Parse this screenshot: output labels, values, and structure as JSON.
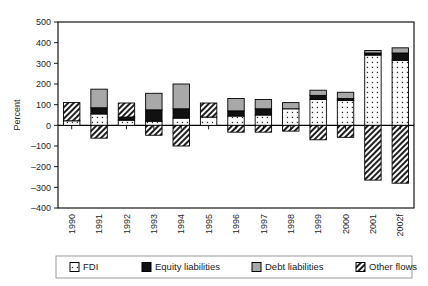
{
  "chart_data": {
    "type": "bar",
    "subtype": "stacked-bar-with-negatives",
    "title": "",
    "xlabel": "",
    "ylabel": "Percent",
    "ylim": [
      -400,
      500
    ],
    "ytick_step": 100,
    "ytick_labels": [
      "500",
      "400",
      "300",
      "200",
      "100",
      "0",
      "–100",
      "–200",
      "–300",
      "–400"
    ],
    "ytick_values": [
      500,
      400,
      300,
      200,
      100,
      0,
      -100,
      -200,
      -300,
      -400
    ],
    "grid": false,
    "legend_position": "bottom",
    "categories": [
      "1990",
      "1991",
      "1992",
      "1993",
      "1994",
      "1995",
      "1996",
      "1997",
      "1998",
      "1999",
      "2000",
      "2001",
      "2002f"
    ],
    "series": [
      {
        "name": "FDI",
        "fill": "dotted-white",
        "color": "#ffffff",
        "values": [
          22,
          55,
          25,
          20,
          35,
          40,
          45,
          50,
          80,
          125,
          120,
          340,
          315
        ]
      },
      {
        "name": "Equity liabilities",
        "fill": "solid-black",
        "color": "#111111",
        "values": [
          0,
          30,
          15,
          55,
          45,
          0,
          25,
          30,
          0,
          20,
          10,
          10,
          35
        ]
      },
      {
        "name": "Debt liabilities",
        "fill": "solid-gray",
        "color": "#a8a8a8",
        "values": [
          0,
          90,
          0,
          80,
          120,
          0,
          60,
          45,
          30,
          25,
          30,
          12,
          25
        ]
      },
      {
        "name": "Other flows",
        "fill": "diagonal-hatch",
        "color": "#ffffff",
        "values": [
          88,
          -62,
          68,
          -48,
          -100,
          68,
          -33,
          -33,
          -28,
          -70,
          -58,
          -265,
          -280
        ]
      }
    ]
  },
  "legend": {
    "items": [
      {
        "label": "FDI",
        "swatch": "fdi-swatch"
      },
      {
        "label": "Equity liabilities",
        "swatch": "equity-swatch"
      },
      {
        "label": "Debt liabilities",
        "swatch": "debt-swatch"
      },
      {
        "label": "Other flows",
        "swatch": "other-flows-swatch"
      }
    ]
  },
  "axes": {
    "y_title": "Percent"
  }
}
